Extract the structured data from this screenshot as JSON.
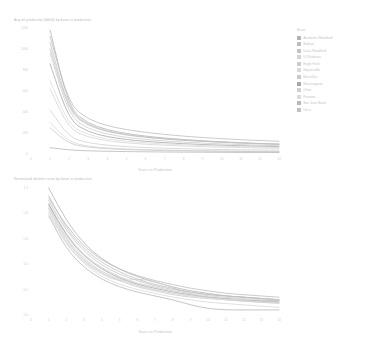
{
  "figure": {
    "background": "#ffffff"
  },
  "charts": [
    {
      "id": "top",
      "title": "Avg oil production (bbl/d) by basin in production",
      "xlabel": "Years on Production",
      "ylabel": ""
    },
    {
      "id": "bottom",
      "title": "Normalized decline curve by basin in production",
      "xlabel": "Years on Production",
      "ylabel": ""
    }
  ],
  "legend": {
    "title": "Basin",
    "items": [
      {
        "label": "Anadarko Woodford",
        "color": "#b2b2b2"
      },
      {
        "label": "Bakken",
        "color": "#bdbdbd"
      },
      {
        "label": "Cana Woodford",
        "color": "#c4c4c4"
      },
      {
        "label": "DJ Niobrara",
        "color": "#d4d4d4"
      },
      {
        "label": "Eagle Ford",
        "color": "#cdcdcd"
      },
      {
        "label": "Haynesville",
        "color": "#d8d8d8"
      },
      {
        "label": "Marcellus",
        "color": "#c9c9c9"
      },
      {
        "label": "Mississippian",
        "color": "#a8a8a8"
      },
      {
        "label": "Other",
        "color": "#d0d0d0"
      },
      {
        "label": "Permian",
        "color": "#dcdcdc"
      },
      {
        "label": "San Juan Basin",
        "color": "#b8b8b8"
      },
      {
        "label": "Utica",
        "color": "#c0c0c0"
      }
    ]
  },
  "chart_data": [
    {
      "type": "line",
      "id": "top",
      "title": "Avg oil production (bbl/d) by basin in production",
      "xlabel": "Years on Production",
      "ylabel": "",
      "xlim": [
        0,
        13
      ],
      "ylim": [
        0,
        1200
      ],
      "xticks": [
        0,
        1,
        2,
        3,
        4,
        5,
        6,
        7,
        8,
        9,
        10,
        11,
        12,
        13
      ],
      "yticks": [
        0,
        200,
        400,
        600,
        800,
        1000,
        1200
      ],
      "ytick_labels": [
        "0",
        "200",
        "400",
        "600",
        "800",
        "1000",
        "1200"
      ],
      "grid": false,
      "legend_position": "right",
      "x": [
        1,
        2,
        3,
        4,
        5,
        6,
        7,
        8,
        9,
        10,
        11,
        12,
        13
      ],
      "series": [
        {
          "name": "Anadarko Woodford",
          "color": "#b2b2b2",
          "values": [
            1180,
            430,
            290,
            230,
            195,
            170,
            152,
            138,
            126,
            116,
            108,
            100,
            94
          ]
        },
        {
          "name": "Bakken",
          "color": "#bdbdbd",
          "values": [
            1120,
            470,
            330,
            268,
            232,
            206,
            186,
            170,
            157,
            146,
            136,
            128,
            121
          ]
        },
        {
          "name": "Cana Woodford",
          "color": "#c4c4c4",
          "values": [
            1000,
            395,
            268,
            212,
            180,
            158,
            142,
            130,
            120,
            111,
            104,
            97,
            92
          ]
        },
        {
          "name": "DJ Niobrara",
          "color": "#d4d4d4",
          "values": [
            620,
            235,
            160,
            126,
            106,
            93,
            83,
            76,
            70,
            65,
            61,
            57,
            54
          ]
        },
        {
          "name": "Eagle Ford",
          "color": "#cdcdcd",
          "values": [
            960,
            360,
            240,
            188,
            158,
            138,
            124,
            113,
            104,
            96,
            90,
            84,
            79
          ]
        },
        {
          "name": "Haynesville",
          "color": "#d8d8d8",
          "values": [
            300,
            112,
            74,
            58,
            48,
            42,
            38,
            34,
            31,
            29,
            27,
            25,
            24
          ]
        },
        {
          "name": "Marcellus",
          "color": "#c9c9c9",
          "values": [
            250,
            95,
            64,
            50,
            42,
            37,
            33,
            30,
            28,
            26,
            24,
            23,
            22
          ]
        },
        {
          "name": "Mississippian",
          "color": "#a8a8a8",
          "values": [
            860,
            318,
            210,
            164,
            138,
            120,
            108,
            98,
            90,
            84,
            78,
            74,
            70
          ]
        },
        {
          "name": "Other",
          "color": "#d0d0d0",
          "values": [
            420,
            158,
            106,
            83,
            70,
            61,
            55,
            50,
            46,
            43,
            40,
            38,
            36
          ]
        },
        {
          "name": "Permian",
          "color": "#dcdcdc",
          "values": [
            700,
            268,
            182,
            143,
            121,
            106,
            95,
            87,
            80,
            75,
            70,
            66,
            62
          ]
        },
        {
          "name": "San Juan Basin",
          "color": "#b8b8b8",
          "values": [
            60,
            38,
            30,
            26,
            23,
            21,
            19,
            18,
            17,
            16,
            15,
            15,
            14
          ]
        },
        {
          "name": "Utica",
          "color": "#c0c0c0",
          "values": [
            1060,
            408,
            276,
            218,
            184,
            161,
            145,
            132,
            122,
            113,
            105,
            99,
            93
          ]
        }
      ]
    },
    {
      "type": "line",
      "id": "bottom",
      "title": "Normalized decline curve by basin in production",
      "xlabel": "Years on Production",
      "ylabel": "",
      "xlim": [
        0,
        14
      ],
      "ylim": [
        0.0,
        1.0
      ],
      "xticks": [
        0,
        1,
        2,
        3,
        4,
        5,
        6,
        7,
        8,
        9,
        10,
        11,
        12,
        13,
        14
      ],
      "yticks": [
        0.0,
        0.2,
        0.4,
        0.6,
        0.8,
        1.0
      ],
      "ytick_labels": [
        "0.0",
        "0.2",
        "0.4",
        "0.6",
        "0.8",
        "1.0"
      ],
      "grid": false,
      "legend_position": "shared-right",
      "x": [
        1,
        2,
        3,
        4,
        5,
        6,
        7,
        8,
        9,
        10,
        11,
        12,
        13,
        14
      ],
      "series": [
        {
          "name": "Anadarko Woodford",
          "color": "#b2b2b2",
          "values": [
            1.0,
            0.74,
            0.56,
            0.44,
            0.36,
            0.3,
            0.26,
            0.22,
            0.19,
            0.17,
            0.15,
            0.14,
            0.13,
            0.12
          ]
        },
        {
          "name": "Bakken",
          "color": "#bdbdbd",
          "values": [
            0.92,
            0.7,
            0.54,
            0.43,
            0.36,
            0.31,
            0.27,
            0.24,
            0.21,
            0.19,
            0.17,
            0.16,
            0.15,
            0.14
          ]
        },
        {
          "name": "Cana Woodford",
          "color": "#c4c4c4",
          "values": [
            0.9,
            0.66,
            0.5,
            0.39,
            0.32,
            0.27,
            0.23,
            0.2,
            0.18,
            0.16,
            0.15,
            0.14,
            0.13,
            0.12
          ]
        },
        {
          "name": "DJ Niobrara",
          "color": "#d4d4d4",
          "values": [
            0.86,
            0.6,
            0.44,
            0.34,
            0.28,
            0.23,
            0.2,
            0.17,
            0.15,
            0.14,
            0.12,
            0.11,
            0.11,
            0.1
          ]
        },
        {
          "name": "Eagle Ford",
          "color": "#cdcdcd",
          "values": [
            0.88,
            0.63,
            0.47,
            0.37,
            0.3,
            0.25,
            0.22,
            0.19,
            0.17,
            0.15,
            0.14,
            0.13,
            0.12,
            0.11
          ]
        },
        {
          "name": "Haynesville",
          "color": "#d8d8d8",
          "values": [
            0.8,
            0.55,
            0.4,
            0.3,
            0.24,
            0.2,
            0.17,
            0.14,
            0.12,
            0.1,
            0.09,
            0.08,
            0.07,
            0.06
          ]
        },
        {
          "name": "Marcellus",
          "color": "#c9c9c9",
          "values": [
            0.84,
            0.58,
            0.42,
            0.33,
            0.27,
            0.22,
            0.19,
            0.16,
            0.14,
            0.13,
            0.12,
            0.11,
            0.1,
            0.1
          ]
        },
        {
          "name": "Mississippian",
          "color": "#a8a8a8",
          "values": [
            0.87,
            0.62,
            0.46,
            0.36,
            0.29,
            0.24,
            0.21,
            0.18,
            0.16,
            0.14,
            0.13,
            0.12,
            0.11,
            0.11
          ]
        },
        {
          "name": "Other",
          "color": "#d0d0d0",
          "values": [
            0.82,
            0.56,
            0.41,
            0.32,
            0.26,
            0.29,
            0.26,
            0.22,
            0.16,
            0.14,
            0.12,
            0.11,
            0.1,
            0.09
          ]
        },
        {
          "name": "Permian",
          "color": "#dcdcdc",
          "values": [
            0.85,
            0.59,
            0.43,
            0.34,
            0.28,
            0.23,
            0.2,
            0.17,
            0.15,
            0.13,
            0.12,
            0.12,
            0.12,
            0.12
          ]
        },
        {
          "name": "San Juan Basin",
          "color": "#b8b8b8",
          "values": [
            0.78,
            0.52,
            0.37,
            0.28,
            0.22,
            0.18,
            0.15,
            0.12,
            0.08,
            0.05,
            0.04,
            0.04,
            0.04,
            0.04
          ]
        },
        {
          "name": "Utica",
          "color": "#c0c0c0",
          "values": [
            0.94,
            0.68,
            0.52,
            0.41,
            0.34,
            0.28,
            0.24,
            0.21,
            0.18,
            0.16,
            0.15,
            0.14,
            0.13,
            0.12
          ]
        }
      ]
    }
  ]
}
